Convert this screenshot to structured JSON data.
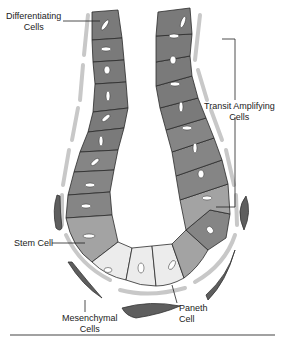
{
  "labels": {
    "differentiating": [
      "Differentiating",
      "Cells"
    ],
    "transit_amplifying": [
      "Transit Amplifying",
      "Cells"
    ],
    "stem_cell": "Stem Cell",
    "mesenchymal": [
      "Mesenchymal",
      "Cells"
    ],
    "paneth": [
      "Paneth",
      "Cell"
    ]
  },
  "colors": {
    "differentiating_cell": "#7a7a7a",
    "transit_amplifying_cell": "#8a8a8a",
    "stem_cell": "#a3a3a3",
    "paneth_cell": "#ececec",
    "nucleus": "#ffffff",
    "cell_outline": "#2b2b2b",
    "basement_membrane": "#c8c8c8",
    "mesenchymal_cell": "#5e5e5e",
    "divider": "#444444"
  }
}
